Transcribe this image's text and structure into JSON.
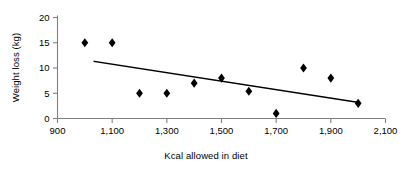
{
  "chart_data": {
    "type": "scatter",
    "title": "",
    "xlabel": "Kcal allowed in diet",
    "ylabel": "Weight loss (kg)",
    "xlim": [
      900,
      2100
    ],
    "ylim": [
      0,
      20
    ],
    "grid": false,
    "legend": "none",
    "x_ticks": [
      900,
      1100,
      1300,
      1500,
      1700,
      1900,
      2100
    ],
    "x_tick_labels": [
      "900",
      "1,100",
      "1,300",
      "1,500",
      "1,700",
      "1,900",
      "2,100"
    ],
    "y_ticks": [
      0,
      5,
      10,
      15,
      20
    ],
    "y_tick_labels": [
      "0",
      "5",
      "10",
      "15",
      "20"
    ],
    "marker": "diamond",
    "marker_color": "#000000",
    "axis_color": "#808080",
    "background_color": "#ffffff",
    "points": [
      {
        "x": 1000,
        "y": 15
      },
      {
        "x": 1100,
        "y": 15
      },
      {
        "x": 1200,
        "y": 5
      },
      {
        "x": 1300,
        "y": 5
      },
      {
        "x": 1400,
        "y": 7
      },
      {
        "x": 1500,
        "y": 8
      },
      {
        "x": 1600,
        "y": 5.4
      },
      {
        "x": 1700,
        "y": 1
      },
      {
        "x": 1800,
        "y": 10
      },
      {
        "x": 1900,
        "y": 8
      },
      {
        "x": 2000,
        "y": 3
      }
    ],
    "trend_line": {
      "color": "#000000",
      "x_start": 1035,
      "y_start": 11.3,
      "x_end": 2000,
      "y_end": 3.2
    }
  }
}
